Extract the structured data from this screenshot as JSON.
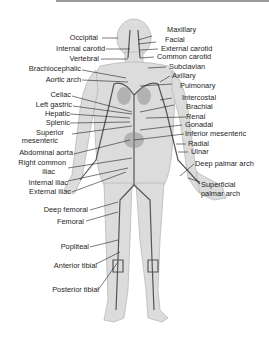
{
  "diagram": {
    "colors": {
      "body": "#dcdcdc",
      "body_outline": "#b9b9b9",
      "artery": "#555555",
      "leader": "#222222",
      "topbar": "#9a9a9a"
    },
    "labels_left": [
      {
        "id": "occipital",
        "text": "Occipital"
      },
      {
        "id": "internal_carotid",
        "text": "Internal carotid"
      },
      {
        "id": "vertebral",
        "text": "Vertebral"
      },
      {
        "id": "brachiocephalic",
        "text": "Brachiocephalic"
      },
      {
        "id": "aortic_arch",
        "text": "Aortic arch"
      },
      {
        "id": "celiac",
        "text": "Celiac"
      },
      {
        "id": "left_gastric",
        "text": "Left gastric"
      },
      {
        "id": "hepatic",
        "text": "Hepatic"
      },
      {
        "id": "splenic",
        "text": "Splenic"
      },
      {
        "id": "superior_mesenteric_1",
        "text": "Superior"
      },
      {
        "id": "superior_mesenteric_2",
        "text": "mesenteric"
      },
      {
        "id": "abdominal_aorta",
        "text": "Abdominal aorta"
      },
      {
        "id": "right_common_iliac_1",
        "text": "Right common"
      },
      {
        "id": "right_common_iliac_2",
        "text": "iliac"
      },
      {
        "id": "internal_iliac",
        "text": "Internal iliac"
      },
      {
        "id": "external_iliac",
        "text": "External iliac"
      },
      {
        "id": "deep_femoral",
        "text": "Deep femoral"
      },
      {
        "id": "femoral",
        "text": "Femoral"
      },
      {
        "id": "popliteal",
        "text": "Popliteal"
      },
      {
        "id": "anterior_tibial",
        "text": "Anterior tibial"
      },
      {
        "id": "posterior_tibial",
        "text": "Posterior tibial"
      }
    ],
    "labels_right": [
      {
        "id": "maxillary",
        "text": "Maxillary"
      },
      {
        "id": "facial",
        "text": "Facial"
      },
      {
        "id": "external_carotid",
        "text": "External carotid"
      },
      {
        "id": "common_carotid",
        "text": "Common carotid"
      },
      {
        "id": "subclavian",
        "text": "Subclavian"
      },
      {
        "id": "axillary",
        "text": "Axillary"
      },
      {
        "id": "pulmonary",
        "text": "Pulmonary"
      },
      {
        "id": "intercostal",
        "text": "Intercostal"
      },
      {
        "id": "brachial",
        "text": "Brachial"
      },
      {
        "id": "renal",
        "text": "Renal"
      },
      {
        "id": "gonadal",
        "text": "Gonadal"
      },
      {
        "id": "inferior_mesenteric",
        "text": "Inferior mesenteric"
      },
      {
        "id": "radial",
        "text": "Radial"
      },
      {
        "id": "ulnar",
        "text": "Ulnar"
      },
      {
        "id": "deep_palmar_arch",
        "text": "Deep palmar arch"
      },
      {
        "id": "superficial_palmar_arch_1",
        "text": "Superficial"
      },
      {
        "id": "superficial_palmar_arch_2",
        "text": "palmar arch"
      }
    ]
  }
}
